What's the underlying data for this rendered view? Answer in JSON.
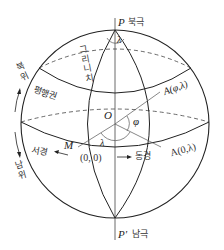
{
  "diagram": {
    "title": "",
    "poles": {
      "north": {
        "symbol": "P",
        "label": "북극"
      },
      "south": {
        "symbol": "P'",
        "label": "남극"
      }
    },
    "center": {
      "symbol": "O"
    },
    "points": {
      "M": {
        "symbol": "M",
        "coord": "(0, 0)"
      },
      "A_equator": {
        "label": "A(0,λ)"
      },
      "A_general": {
        "label": "A(φ,λ)"
      }
    },
    "angles": {
      "lambda_top": "λ",
      "lambda_equator": "λ",
      "phi": "φ"
    },
    "lines": {
      "greenwich_meridian": "그리니치",
      "parallel": "평행권",
      "west_longitude": "서경",
      "east_longitude": "동경",
      "north_latitude": "북위",
      "south_latitude": "남위"
    },
    "colors": {
      "stroke": "#222222",
      "text": "#333333",
      "background": "#ffffff"
    }
  }
}
